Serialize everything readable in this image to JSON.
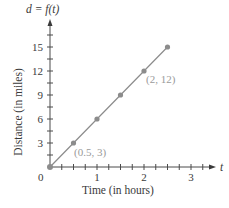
{
  "chart_data": {
    "type": "line",
    "title": "d = f(t)",
    "xlabel": "Time (in hours)",
    "ylabel": "Distance (in miles)",
    "x_axis_var": "t",
    "y_axis_var": "d = f(t)",
    "xlim": [
      0,
      3.5
    ],
    "ylim": [
      0,
      17
    ],
    "x_ticks": [
      0,
      1,
      2,
      3
    ],
    "x_tick_labels": [
      "0",
      "1",
      "2",
      "3"
    ],
    "x_minor_step": 0.25,
    "y_ticks": [
      3,
      6,
      9,
      12,
      15
    ],
    "y_tick_labels": [
      "3",
      "6",
      "9",
      "12",
      "15"
    ],
    "y_minor_step": 1.5,
    "series": [
      {
        "name": "d = f(t)",
        "x": [
          0,
          0.5,
          1,
          1.5,
          2,
          2.5
        ],
        "y": [
          0,
          3,
          6,
          9,
          12,
          15
        ],
        "color": "#8c8c8c"
      }
    ],
    "annotations": [
      {
        "text": "(0.5, 3)",
        "x": 0.5,
        "y": 3
      },
      {
        "text": "(2, 12)",
        "x": 2,
        "y": 12
      }
    ],
    "grid": false,
    "legend": null
  },
  "labels": {
    "function": "d = f(t)",
    "x_var": "t",
    "x_axis_title": "Time (in hours)",
    "y_axis_title": "Distance (in miles)",
    "origin": "0",
    "ann_1": "(0.5, 3)",
    "ann_2": "(2, 12)"
  }
}
